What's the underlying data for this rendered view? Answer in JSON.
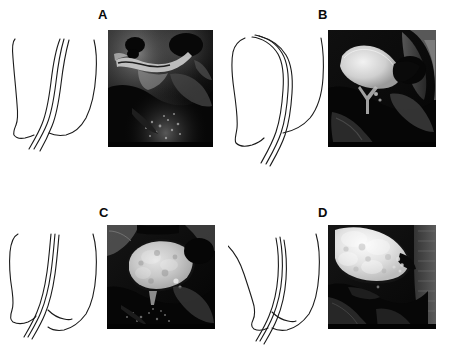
{
  "figure": {
    "type": "medical-figure-plate",
    "layout": "2x2 grid of panels; each panel has a schematic line drawing on the left and a sagittal MRI image on the right",
    "background_color": "#ffffff",
    "width": 450,
    "height": 352,
    "panels": [
      {
        "id": "A",
        "label": "A",
        "label_x": 98,
        "label_y": 8,
        "diagram": {
          "name": "schematic-line-drawing-a",
          "description": "sagittal outline of pelvic floor with three parallel curved lines (urethra / vaginal walls) between anterior and posterior body contours",
          "x": 6,
          "y": 32,
          "width": 96,
          "height": 130,
          "stroke_color": "#1a1a1a",
          "stroke_width": 1.1
        },
        "mri": {
          "name": "mri-image-a",
          "description": "sagittal pelvic MRI, bladder empty, bright linear structure across mid-field",
          "x": 108,
          "y": 30,
          "width": 105,
          "height": 117,
          "background_color": "#050505",
          "bright_color": "#d8d8d8",
          "mid_color": "#6e6e6e"
        }
      },
      {
        "id": "B",
        "label": "B",
        "label_x": 318,
        "label_y": 8,
        "diagram": {
          "name": "schematic-line-drawing-b",
          "description": "sagittal outline with rounded anterior bladder contour and three parallel curved lines descending to the pelvic outlet",
          "x": 230,
          "y": 32,
          "width": 96,
          "height": 140,
          "stroke_color": "#1a1a1a",
          "stroke_width": 1.1
        },
        "mri": {
          "name": "mri-image-b",
          "description": "sagittal pelvic MRI with bright partially filled bladder in upper left quadrant",
          "x": 328,
          "y": 30,
          "width": 108,
          "height": 117,
          "background_color": "#050505",
          "bright_color": "#e4e4e4",
          "mid_color": "#7a7a7a"
        }
      },
      {
        "id": "C",
        "label": "C",
        "label_x": 99,
        "label_y": 206,
        "diagram": {
          "name": "schematic-line-drawing-c",
          "description": "sagittal outline with large rounded contour and three parallel curved lines; posterior contour bulges",
          "x": 6,
          "y": 230,
          "width": 96,
          "height": 120,
          "stroke_color": "#1a1a1a",
          "stroke_width": 1.1
        },
        "mri": {
          "name": "mri-image-c",
          "description": "sagittal pelvic MRI with large bright distended bladder outlined by dark wall",
          "x": 107,
          "y": 225,
          "width": 108,
          "height": 104,
          "background_color": "#050505",
          "bright_color": "#dcdcdc",
          "mid_color": "#8a8a8a"
        }
      },
      {
        "id": "D",
        "label": "D",
        "label_x": 318,
        "label_y": 206,
        "diagram": {
          "name": "schematic-line-drawing-d",
          "description": "sagittal outline with narrow anterior contour and three parallel curved lines descending steeply",
          "x": 228,
          "y": 230,
          "width": 96,
          "height": 120,
          "stroke_color": "#1a1a1a",
          "stroke_width": 1.1
        },
        "mri": {
          "name": "mri-image-d",
          "description": "sagittal pelvic MRI with very bright distended bladder occupying upper left, descended pelvic floor",
          "x": 328,
          "y": 225,
          "width": 108,
          "height": 104,
          "background_color": "#050505",
          "bright_color": "#f0f0f0",
          "mid_color": "#909090"
        }
      }
    ]
  }
}
